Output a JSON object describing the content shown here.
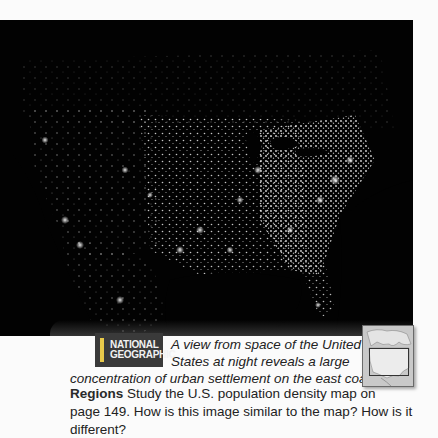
{
  "photo": {
    "subject": "night-time satellite view of the United States",
    "background_color": "#020202",
    "light_color": "#f4f4f4"
  },
  "logo": {
    "line1": "NATIONAL",
    "line2": "GEOGRAPHIC",
    "background_color": "#3a3a3a",
    "accent_color": "#e8c94a"
  },
  "caption": {
    "line1": "A view from space of the United",
    "line2": "States at night reveals a large",
    "line3": "concentration of urban settlement on the east coast."
  },
  "question": {
    "label": "Regions",
    "line1": " Study the U.S. population density map on",
    "line2": "page 149. How is this image similar to the map? How is it different?"
  },
  "locator_map": {
    "subject": "North America locator map with United States highlighted"
  }
}
